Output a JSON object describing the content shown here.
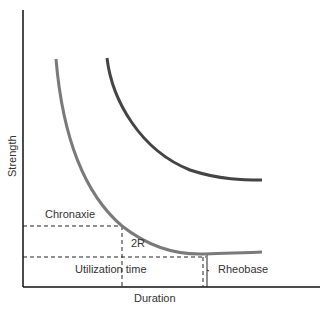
{
  "diagram": {
    "axes": {
      "x_label": "Duration",
      "y_label": "Strength"
    },
    "labels": {
      "chronaxie": "Chronaxie",
      "two_r": "2R",
      "utilization_time": "Utilization time",
      "rheobase": "Rheobase"
    },
    "curves": [
      {
        "name": "strength-duration-curve",
        "color": "#7a7a7a"
      },
      {
        "name": "shifted-curve",
        "color": "#444444"
      }
    ],
    "colors": {
      "axis": "#111111",
      "dashed": "#222222",
      "text": "#333333"
    }
  }
}
